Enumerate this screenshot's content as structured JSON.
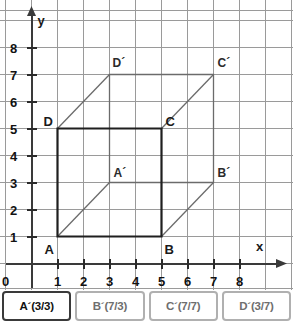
{
  "graph": {
    "axes": {
      "x_name": "x",
      "y_name": "y",
      "origin_label": "0",
      "x_ticks": [
        "1",
        "2",
        "3",
        "4",
        "5",
        "6",
        "7",
        "8"
      ],
      "y_ticks": [
        "1",
        "2",
        "3",
        "4",
        "5",
        "6",
        "7",
        "8"
      ],
      "x_range": [
        0,
        8
      ],
      "y_range": [
        0,
        8
      ]
    },
    "grid": {
      "visible": true,
      "color": "#9a9a9a",
      "spacing": 1
    },
    "front_face": {
      "name": "ABCD",
      "stroke": "#1f1f1f",
      "vertices": [
        {
          "label": "A",
          "x": 1,
          "y": 1
        },
        {
          "label": "B",
          "x": 5,
          "y": 1
        },
        {
          "label": "C",
          "x": 5,
          "y": 5
        },
        {
          "label": "D",
          "x": 1,
          "y": 5
        }
      ]
    },
    "back_face": {
      "name": "A'B'C'D'",
      "stroke": "#6b6b6b",
      "vertices": [
        {
          "label": "A´",
          "x": 3,
          "y": 3
        },
        {
          "label": "B´",
          "x": 7,
          "y": 3
        },
        {
          "label": "C´",
          "x": 7,
          "y": 7
        },
        {
          "label": "D´",
          "x": 3,
          "y": 7
        }
      ]
    },
    "connectors": [
      {
        "from": "A",
        "to": "A´"
      },
      {
        "from": "B",
        "to": "B´"
      },
      {
        "from": "C",
        "to": "C´"
      },
      {
        "from": "D",
        "to": "D´"
      }
    ]
  },
  "answers": {
    "options": [
      {
        "label": "A´(3/3)",
        "selected": true
      },
      {
        "label": "B´(7/3)",
        "selected": false
      },
      {
        "label": "C´(7/7)",
        "selected": false
      },
      {
        "label": "D´(3/7)",
        "selected": false
      }
    ]
  },
  "chart_data": {
    "type": "scatter",
    "title": "",
    "xlabel": "x",
    "ylabel": "y",
    "xlim": [
      0,
      8.6
    ],
    "ylim": [
      0,
      8.6
    ],
    "grid": true,
    "legend": "none",
    "points": [
      {
        "name": "A",
        "x": 1,
        "y": 1
      },
      {
        "name": "B",
        "x": 5,
        "y": 1
      },
      {
        "name": "C",
        "x": 5,
        "y": 5
      },
      {
        "name": "D",
        "x": 1,
        "y": 5
      },
      {
        "name": "A´",
        "x": 3,
        "y": 3
      },
      {
        "name": "B´",
        "x": 7,
        "y": 3
      },
      {
        "name": "C´",
        "x": 7,
        "y": 7
      },
      {
        "name": "D´",
        "x": 3,
        "y": 7
      }
    ],
    "edges": [
      [
        "A",
        "B"
      ],
      [
        "B",
        "C"
      ],
      [
        "C",
        "D"
      ],
      [
        "D",
        "A"
      ],
      [
        "A´",
        "B´"
      ],
      [
        "B´",
        "C´"
      ],
      [
        "C´",
        "D´"
      ],
      [
        "D´",
        "A´"
      ],
      [
        "A",
        "A´"
      ],
      [
        "B",
        "B´"
      ],
      [
        "C",
        "C´"
      ],
      [
        "D",
        "D´"
      ]
    ]
  }
}
